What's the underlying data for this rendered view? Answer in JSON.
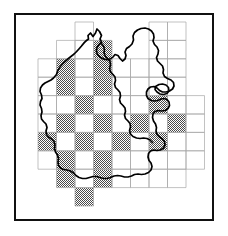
{
  "figure": {
    "type": "distribution-map",
    "title": "",
    "frame": {
      "stroke": "#111111",
      "stroke_width": 2,
      "fill": "#ffffff"
    },
    "background": "#ffffff"
  },
  "chart_data": {
    "type": "heatmap",
    "title": "",
    "subtitle": "",
    "xlabel": "",
    "ylabel": "",
    "grid": true,
    "legend": null,
    "colors": {
      "shaded_fill": "#9a9a9a",
      "unshaded_fill": "#ffffff",
      "grid_line": "#a8a8a8",
      "outline_stroke": "#000000",
      "frame_stroke": "#111111"
    },
    "grid_geometry": {
      "origin_x": 38,
      "origin_y": 22,
      "cell_width": 18.5,
      "cell_height": 18.4,
      "n_cols": 8,
      "n_rows": 10,
      "note": "Grid is a ragged rectangle; only cells listed in present_cells are drawn."
    },
    "categories": [
      "c0",
      "c1",
      "c2",
      "c3",
      "c4",
      "c5",
      "c6",
      "c7"
    ],
    "row_labels": [
      "r0",
      "r1",
      "r2",
      "r3",
      "r4",
      "r5",
      "r6",
      "r7",
      "r8",
      "r9"
    ],
    "present_cells": [
      [
        2,
        0
      ],
      [
        6,
        0
      ],
      [
        7,
        0
      ],
      [
        1,
        1
      ],
      [
        2,
        1
      ],
      [
        3,
        1
      ],
      [
        6,
        1
      ],
      [
        7,
        1
      ],
      [
        0,
        2
      ],
      [
        1,
        2
      ],
      [
        2,
        2
      ],
      [
        3,
        2
      ],
      [
        4,
        2
      ],
      [
        5,
        2
      ],
      [
        6,
        2
      ],
      [
        7,
        2
      ],
      [
        0,
        3
      ],
      [
        1,
        3
      ],
      [
        2,
        3
      ],
      [
        3,
        3
      ],
      [
        4,
        3
      ],
      [
        5,
        3
      ],
      [
        6,
        3
      ],
      [
        7,
        3
      ],
      [
        0,
        4
      ],
      [
        1,
        4
      ],
      [
        2,
        4
      ],
      [
        3,
        4
      ],
      [
        4,
        4
      ],
      [
        5,
        4
      ],
      [
        6,
        4
      ],
      [
        7,
        4
      ],
      [
        8,
        4
      ],
      [
        0,
        5
      ],
      [
        1,
        5
      ],
      [
        2,
        5
      ],
      [
        3,
        5
      ],
      [
        4,
        5
      ],
      [
        5,
        5
      ],
      [
        6,
        5
      ],
      [
        7,
        5
      ],
      [
        8,
        5
      ],
      [
        0,
        6
      ],
      [
        1,
        6
      ],
      [
        2,
        6
      ],
      [
        3,
        6
      ],
      [
        4,
        6
      ],
      [
        5,
        6
      ],
      [
        6,
        6
      ],
      [
        7,
        6
      ],
      [
        8,
        6
      ],
      [
        0,
        7
      ],
      [
        1,
        7
      ],
      [
        2,
        7
      ],
      [
        3,
        7
      ],
      [
        4,
        7
      ],
      [
        5,
        7
      ],
      [
        6,
        7
      ],
      [
        7,
        7
      ],
      [
        8,
        7
      ],
      [
        1,
        8
      ],
      [
        2,
        8
      ],
      [
        3,
        8
      ],
      [
        4,
        8
      ],
      [
        5,
        8
      ],
      [
        6,
        8
      ],
      [
        7,
        8
      ],
      [
        2,
        9
      ]
    ],
    "shaded_cells": [
      [
        3,
        1
      ],
      [
        1,
        2
      ],
      [
        3,
        2
      ],
      [
        1,
        3
      ],
      [
        3,
        3
      ],
      [
        2,
        4
      ],
      [
        6,
        4
      ],
      [
        1,
        5
      ],
      [
        3,
        5
      ],
      [
        5,
        5
      ],
      [
        7,
        5
      ],
      [
        0,
        6
      ],
      [
        2,
        6
      ],
      [
        4,
        6
      ],
      [
        6,
        6
      ],
      [
        1,
        7
      ],
      [
        3,
        7
      ],
      [
        1,
        8
      ],
      [
        3,
        8
      ],
      [
        2,
        9
      ]
    ],
    "values_note": "1 = shaded (species recorded), 0 = unshaded (no record)",
    "matrix": [
      [
        0,
        0,
        0,
        0,
        0,
        0,
        0,
        0,
        0
      ],
      [
        0,
        0,
        0,
        1,
        0,
        0,
        0,
        0,
        0
      ],
      [
        0,
        1,
        0,
        1,
        0,
        0,
        0,
        0,
        0
      ],
      [
        0,
        1,
        0,
        1,
        0,
        0,
        0,
        0,
        0
      ],
      [
        0,
        0,
        1,
        0,
        0,
        0,
        1,
        0,
        0
      ],
      [
        0,
        1,
        0,
        1,
        0,
        1,
        0,
        1,
        0
      ],
      [
        1,
        0,
        1,
        0,
        1,
        0,
        1,
        0,
        0
      ],
      [
        0,
        1,
        0,
        1,
        0,
        0,
        0,
        0,
        0
      ],
      [
        0,
        1,
        0,
        1,
        0,
        0,
        0,
        0,
        0
      ],
      [
        0,
        0,
        1,
        0,
        0,
        0,
        0,
        0,
        0
      ]
    ],
    "shaded_count": 21,
    "total_cells": 70
  },
  "region_outline": {
    "name": "county-boundary",
    "stroke": "#000000",
    "stroke_width": 1.6,
    "fill": "none"
  }
}
